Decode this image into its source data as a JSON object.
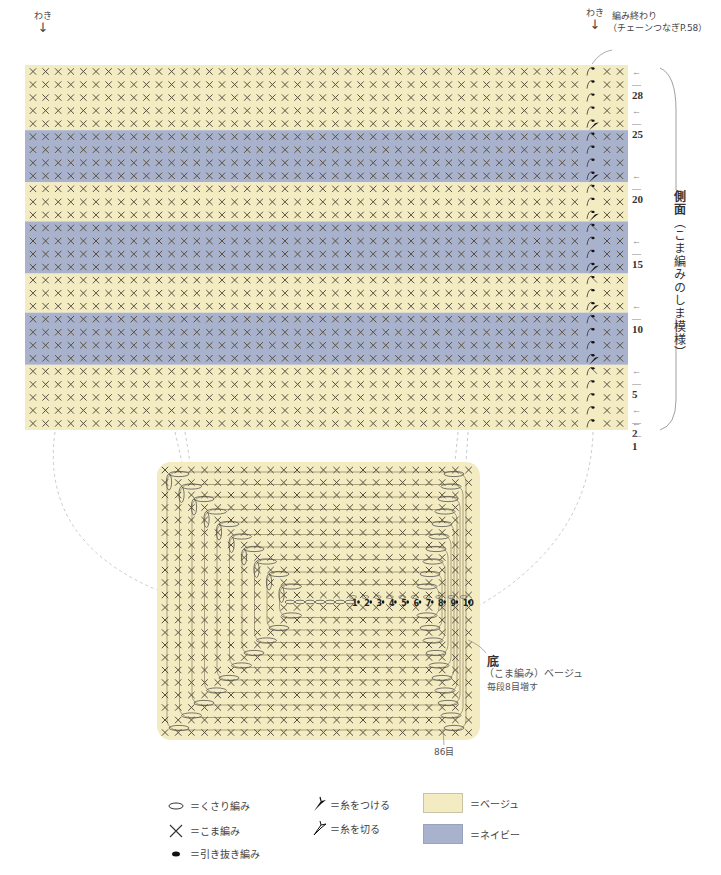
{
  "side_panel": {
    "title": "側面",
    "subtitle": "（こま編みのしま模様）",
    "left_marker": "わき",
    "right_marker": "わき",
    "finish_note_line1": "編み終わり",
    "finish_note_line2": "（チェーンつなぎP.58）",
    "total_rows": 28,
    "row_labels": [
      {
        "row": 28,
        "label": "28"
      },
      {
        "row": 25,
        "label": "25"
      },
      {
        "row": 20,
        "label": "20"
      },
      {
        "row": 15,
        "label": "15"
      },
      {
        "row": 10,
        "label": "10"
      },
      {
        "row": 5,
        "label": "5"
      },
      {
        "row": 2,
        "label": "2"
      },
      {
        "row": 1,
        "label": "1"
      }
    ],
    "stripes_top_to_bottom": [
      {
        "color": "beige",
        "rows": 5
      },
      {
        "color": "navy",
        "rows": 4
      },
      {
        "color": "beige",
        "rows": 3
      },
      {
        "color": "navy",
        "rows": 4
      },
      {
        "color": "beige",
        "rows": 3
      },
      {
        "color": "navy",
        "rows": 4
      },
      {
        "color": "beige",
        "rows": 5
      }
    ]
  },
  "bottom_panel": {
    "title": "底",
    "subtitle": "（こま編み）ベージュ",
    "note": "毎段8目増す",
    "stitch_count": "86目",
    "round_labels": [
      "1",
      "2",
      "3",
      "4",
      "5",
      "6",
      "7",
      "8",
      "9",
      "10"
    ]
  },
  "legend": {
    "items": [
      {
        "icon": "chain-stitch-icon",
        "label": "＝くさり編み"
      },
      {
        "icon": "single-crochet-icon",
        "label": "＝こま編み"
      },
      {
        "icon": "slip-stitch-icon",
        "label": "＝引き抜き編み"
      },
      {
        "icon": "join-yarn-icon",
        "label": "＝糸をつける"
      },
      {
        "icon": "cut-yarn-icon",
        "label": "＝糸を切る"
      }
    ],
    "colors": [
      {
        "name": "beige",
        "label": "＝ベージュ",
        "hex": "#f3ebc1"
      },
      {
        "name": "navy",
        "label": "＝ネイビー",
        "hex": "#a8b2cc"
      }
    ]
  },
  "colors": {
    "beige": "#f3ebc1",
    "navy": "#a8b2cc",
    "stitch": "#5a5040",
    "outline": "#8a8060"
  }
}
